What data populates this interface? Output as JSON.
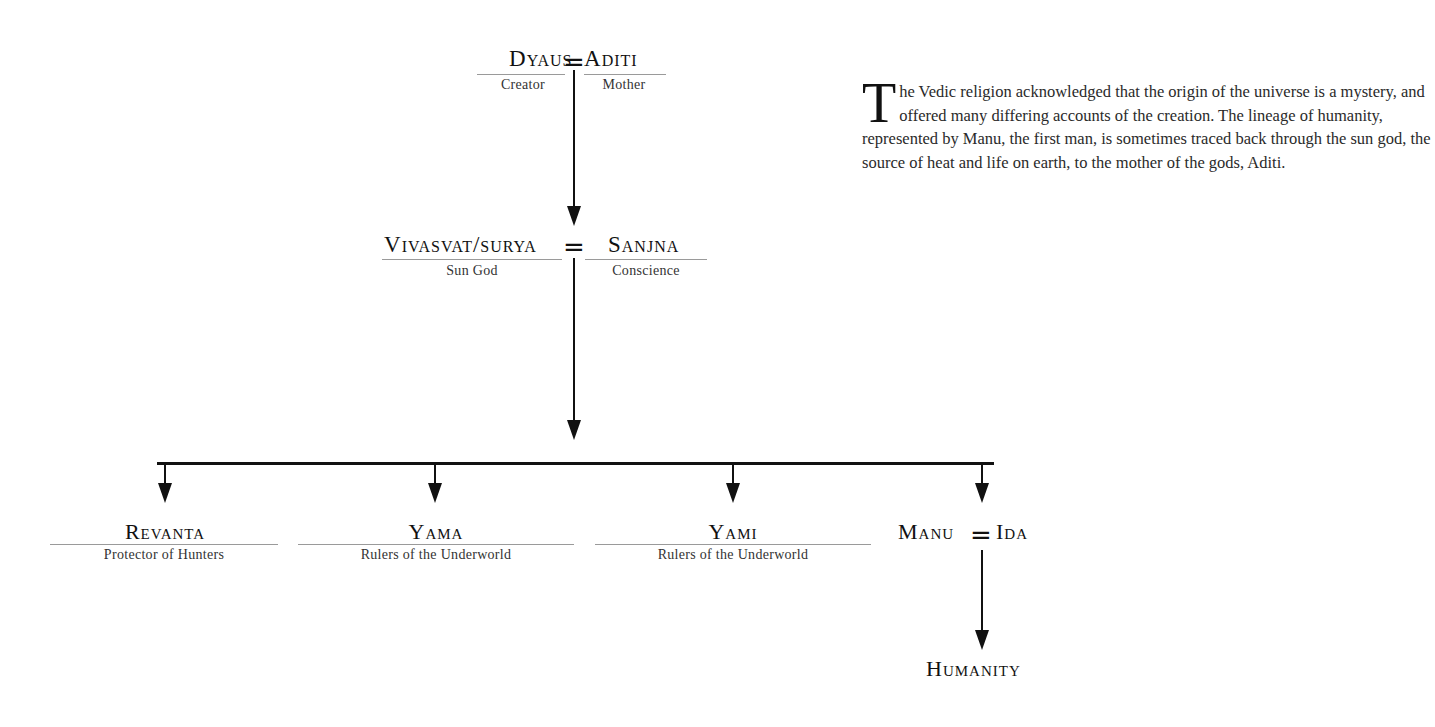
{
  "diagram": {
    "type": "family-tree",
    "root_couple": {
      "left": {
        "name": "Dyaus",
        "role": "Creator"
      },
      "connector": "=",
      "right": {
        "name": "Aditi",
        "role": "Mother"
      }
    },
    "second_couple": {
      "left": {
        "name": "Vivasvat/Surya",
        "role": "Sun God"
      },
      "connector": "=",
      "right": {
        "name": "Sanjna",
        "role": "Conscience"
      }
    },
    "children": [
      {
        "name": "Revanta",
        "role": "Protector of Hunters"
      },
      {
        "name": "Yama",
        "role": "Rulers of the Underworld"
      },
      {
        "name": "Yami",
        "role": "Rulers of the Underworld"
      },
      {
        "name": "Manu = Ida",
        "left": "Manu",
        "connector": "=",
        "right": "Ida"
      }
    ],
    "descendant": {
      "name": "Humanity"
    }
  },
  "text": {
    "dropcap": "T",
    "paragraph_rest": "he Vedic religion acknowledged that the origin of the universe is a mystery, and offered many differing accounts of the creation. The lineage of humanity, represented by Manu, the first man, is sometimes traced back through the sun god, the source of heat and life on earth, to the mother of the gods, Aditi."
  }
}
